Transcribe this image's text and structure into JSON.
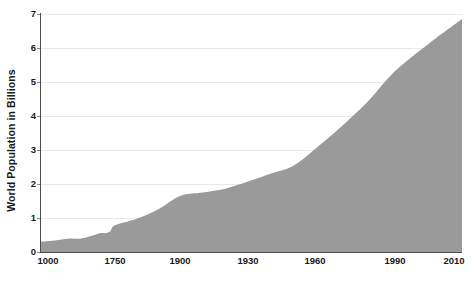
{
  "chart_data": {
    "type": "area",
    "title": "",
    "subtitle": "",
    "xlabel": "",
    "ylabel": "World Population in Billions",
    "ylim": [
      0,
      7
    ],
    "xlim": [
      1000,
      2010
    ],
    "grid": true,
    "legend": false,
    "legend_position": "none",
    "fill_color": "#9a9a9a",
    "gridline_color": "#e9e9e9",
    "axis_color": "#4d4d4d",
    "text_color": "#1a1a1a",
    "background_color": "#ffffff",
    "y_ticks": [
      "7",
      "6",
      "5",
      "4",
      "3",
      "2",
      "1",
      "0"
    ],
    "y_tick_values": [
      7,
      6,
      5,
      4,
      3,
      2,
      1,
      0
    ],
    "x_ticks": [
      "1000",
      "1750",
      "1900",
      "1930",
      "1960",
      "1990",
      "2010"
    ],
    "x_tick_values": [
      1000,
      1750,
      1900,
      1930,
      1960,
      1990,
      2010
    ],
    "x_tick_positions_px": [
      40,
      115,
      180,
      248,
      315,
      395,
      462
    ],
    "x_axis_note": "non-linear spacing: equal pixel gaps between unequal year intervals",
    "series": [
      {
        "name": "World Population",
        "x": [
          1000,
          1100,
          1200,
          1300,
          1400,
          1500,
          1600,
          1650,
          1700,
          1750,
          1800,
          1850,
          1900,
          1910,
          1920,
          1930,
          1940,
          1950,
          1960,
          1970,
          1980,
          1990,
          2000,
          2010
        ],
        "values": [
          0.3,
          0.32,
          0.36,
          0.4,
          0.39,
          0.46,
          0.55,
          0.55,
          0.6,
          0.79,
          0.98,
          1.26,
          1.65,
          1.75,
          1.86,
          2.07,
          2.3,
          2.52,
          3.03,
          3.7,
          4.44,
          5.32,
          6.12,
          6.85
        ]
      }
    ],
    "annotations": []
  }
}
